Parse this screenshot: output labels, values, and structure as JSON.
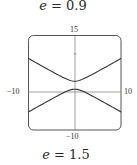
{
  "captions": {
    "top": {
      "var": "e",
      "rest": " = 0.9"
    },
    "bottom": {
      "var": "e",
      "rest": " = 1.5"
    }
  },
  "chart_data": {
    "type": "line",
    "title": "e = 1.5",
    "xlabel": "",
    "ylabel": "",
    "xlim": [
      -10,
      10
    ],
    "ylim": [
      -10,
      15
    ],
    "tick_labels": {
      "x_min": "−10",
      "x_max": "10",
      "y_min": "−10",
      "y_max": "15"
    },
    "grid": false,
    "curve": "hyperbola (polar conic r = ed/(1 - e sinθ), e = 1.5)",
    "series": [
      {
        "name": "upper branch",
        "x": [
          -10,
          -5,
          -2,
          0,
          2,
          5,
          10
        ],
        "y": [
          8.9,
          5.3,
          3.4,
          2.9,
          3.4,
          5.3,
          8.9
        ]
      },
      {
        "name": "lower branch",
        "x": [
          -10,
          -5,
          -2,
          0,
          2,
          5,
          10
        ],
        "y": [
          -7.1,
          -3.5,
          -1.6,
          0.8,
          -1.6,
          -3.5,
          -7.1
        ]
      }
    ],
    "hyperbola_params": {
      "center_y": 1.85,
      "a": 1.05,
      "b": 1.5
    },
    "color": "#333333"
  },
  "labels": {
    "y_top": "15",
    "y_bottom": "−10",
    "x_left": "−10",
    "x_right": "10"
  }
}
